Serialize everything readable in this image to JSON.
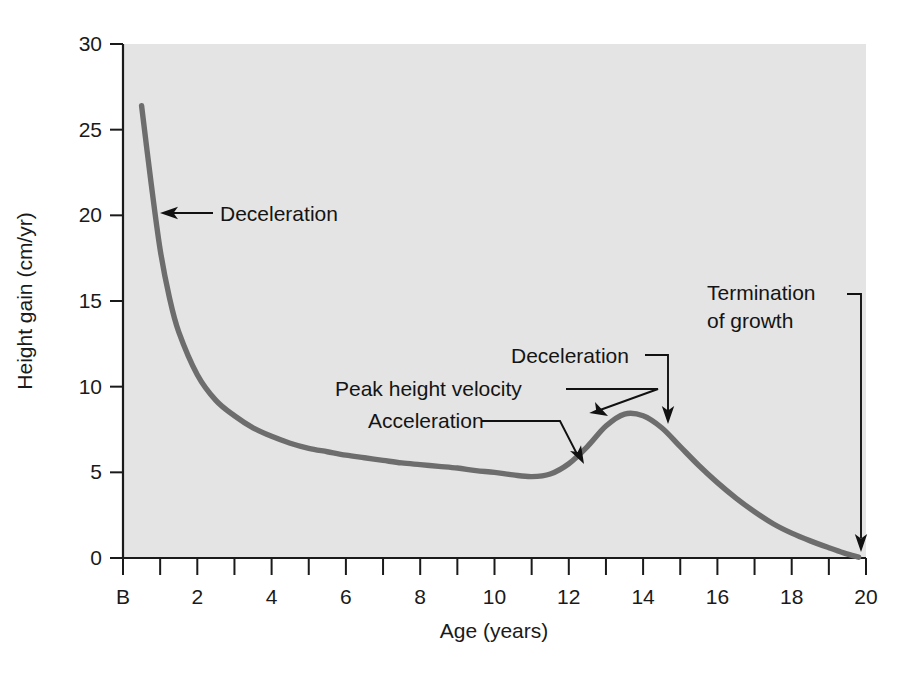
{
  "chart_data": {
    "type": "line",
    "title": "",
    "xlabel": "Age (years)",
    "ylabel": "Height gain (cm/yr)",
    "xlim": [
      0,
      20
    ],
    "ylim": [
      0,
      30
    ],
    "grid": false,
    "legend": "none",
    "x_tick_labels": [
      "B",
      "2",
      "4",
      "6",
      "8",
      "10",
      "12",
      "14",
      "16",
      "18",
      "20"
    ],
    "x_tick_values": [
      0,
      2,
      4,
      6,
      8,
      10,
      12,
      14,
      16,
      18,
      20
    ],
    "x_minor_tick_values": [
      1,
      3,
      5,
      7,
      9,
      11,
      13,
      15,
      17,
      19
    ],
    "y_tick_labels": [
      "0",
      "5",
      "10",
      "15",
      "20",
      "25",
      "30"
    ],
    "y_tick_values": [
      0,
      5,
      10,
      15,
      20,
      25,
      30
    ],
    "series": [
      {
        "name": "Height velocity",
        "x": [
          0.5,
          0.75,
          1,
          1.25,
          1.5,
          2,
          2.5,
          3,
          3.5,
          4,
          4.5,
          5,
          5.5,
          6,
          6.5,
          7,
          7.5,
          8,
          8.5,
          9,
          9.5,
          10,
          10.5,
          11,
          11.5,
          12,
          12.5,
          13,
          13.5,
          14,
          14.5,
          15,
          15.5,
          16,
          16.5,
          17,
          17.5,
          18,
          18.5,
          19,
          19.4,
          19.8
        ],
        "y": [
          26.4,
          22.0,
          18.0,
          15.2,
          13.2,
          10.7,
          9.2,
          8.3,
          7.6,
          7.1,
          6.7,
          6.4,
          6.2,
          6.0,
          5.85,
          5.7,
          5.55,
          5.45,
          5.35,
          5.25,
          5.1,
          5.0,
          4.85,
          4.75,
          4.9,
          5.5,
          6.5,
          7.7,
          8.4,
          8.3,
          7.6,
          6.5,
          5.4,
          4.4,
          3.5,
          2.7,
          2.0,
          1.45,
          1.0,
          0.6,
          0.3,
          0.05
        ]
      }
    ],
    "annotations": [
      {
        "id": "deceleration-infancy",
        "text": "Deceleration",
        "text_x": 220,
        "text_y": 221,
        "anchor": "start",
        "arrow_from_x": 213,
        "arrow_from_y": 213,
        "arrow_to_x": 160,
        "arrow_to_y": 213
      },
      {
        "id": "peak-height-velocity",
        "text": "Peak height velocity",
        "text_x": 335,
        "text_y": 396,
        "anchor": "start",
        "arrow_to_x": 608,
        "arrow_to_y": 414
      },
      {
        "id": "acceleration",
        "text": "Acceleration",
        "text_x": 368,
        "text_y": 428,
        "anchor": "start",
        "arrow_to_x": 585,
        "arrow_to_y": 463
      },
      {
        "id": "deceleration-adolescence",
        "text": "Deceleration",
        "text_x": 511,
        "text_y": 363,
        "anchor": "start",
        "arrow_to_x": 665,
        "arrow_to_y": 424
      },
      {
        "id": "termination-of-growth-line1",
        "text": "Termination",
        "text_x": 707,
        "text_y": 300,
        "anchor": "start"
      },
      {
        "id": "termination-of-growth-line2",
        "text": "of growth",
        "text_x": 707,
        "text_y": 328,
        "anchor": "start",
        "arrow_to_x": 860,
        "arrow_to_y": 552
      }
    ]
  },
  "colors": {
    "plot_background": "#e4e4e4",
    "page_background": "#ffffff",
    "curve": "#6d6d6d",
    "axis": "#1a1a1a",
    "annotation": "#111111"
  },
  "geometry": {
    "plot_left": 123,
    "plot_right": 866,
    "plot_top": 44,
    "plot_bottom": 558
  }
}
